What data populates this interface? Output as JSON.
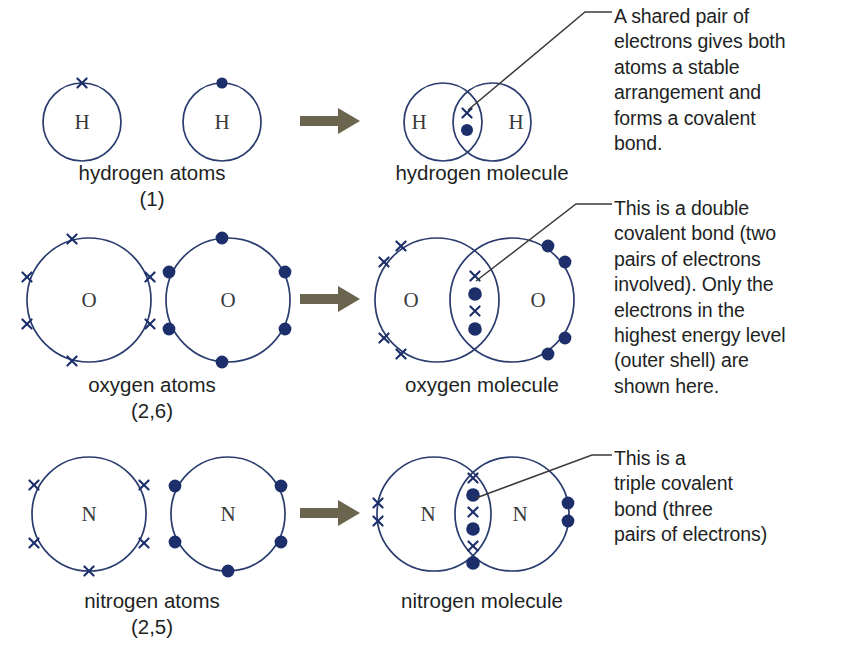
{
  "figure": {
    "title_visible": false,
    "colors": {
      "shell_outline": "#2a3b6e",
      "electron_dot": "#1c2f6b",
      "electron_cross": "#1c2f6b",
      "arrow": "#6b6550",
      "leader_line": "#3a3a3a",
      "text": "#221f1f",
      "background": "#ffffff"
    }
  },
  "rows": [
    {
      "id": "hydrogen",
      "element_symbol": "H",
      "atoms_caption": "hydrogen atoms\n(1)",
      "molecule_caption": "hydrogen molecule",
      "electron_config": "(1)",
      "atom_left_electron_count": 1,
      "atom_right_electron_count": 1,
      "shared_pairs": 1,
      "bond_type": "single covalent bond",
      "annotation": "A shared pair of\nelectrons gives both\natoms a stable\narrangement and\nforms a covalent\nbond."
    },
    {
      "id": "oxygen",
      "element_symbol": "O",
      "atoms_caption": "oxygen atoms\n(2,6)",
      "molecule_caption": "oxygen molecule",
      "electron_config": "(2,6)",
      "atom_left_electron_count": 6,
      "atom_right_electron_count": 6,
      "shared_pairs": 2,
      "bond_type": "double covalent bond",
      "annotation": "This is a double\ncovalent bond (two\npairs of electrons\ninvolved). Only the\nelectrons in the\nhighest energy level\n(outer shell) are\nshown here."
    },
    {
      "id": "nitrogen",
      "element_symbol": "N",
      "atoms_caption": "nitrogen atoms\n(2,5)",
      "molecule_caption": "nitrogen molecule",
      "electron_config": "(2,5)",
      "atom_left_electron_count": 5,
      "atom_right_electron_count": 5,
      "shared_pairs": 3,
      "bond_type": "triple covalent bond",
      "annotation": "This is a\ntriple covalent\nbond (three\npairs of electrons)"
    }
  ],
  "symbols": {
    "cross": "×",
    "dot": "●",
    "arrow": "➡"
  }
}
